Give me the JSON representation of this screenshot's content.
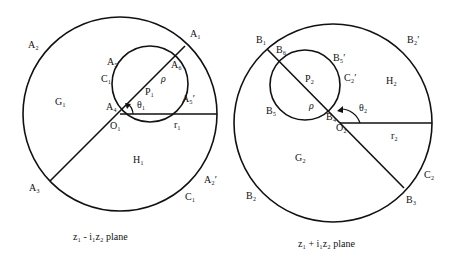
{
  "left_panel": {
    "caption": "z₁ - i₁z₂  plane",
    "labels": {
      "A1": "A₁",
      "A2": "A₂",
      "A3": "A₃",
      "A4": "A₄",
      "A5": "A₅",
      "A6": "A₆",
      "A5p": "A₅′",
      "A2p": "A₂′",
      "C1_small": "C₁",
      "C1": "C₁",
      "G1": "G₁",
      "H1": "H₁",
      "O1": "O₁",
      "P1": "P₁",
      "rho": "ρ",
      "theta1": "θ₁",
      "r1": "r₁"
    }
  },
  "right_panel": {
    "caption": "z₁ + i₁z₂  plane",
    "labels": {
      "B1": "B₁",
      "B2": "B₂",
      "B3": "B₃",
      "B4": "B₄",
      "B5": "B₅",
      "B6": "B₆",
      "B5p": "B₅′",
      "B2p": "B₂′",
      "C2_small": "C₂′",
      "C2": "C₂",
      "G2": "G₂",
      "H2": "H₂",
      "O2": "O₂",
      "P2": "P₂",
      "rho": "ρ",
      "theta2": "θ₂",
      "r2": "r₂"
    }
  }
}
